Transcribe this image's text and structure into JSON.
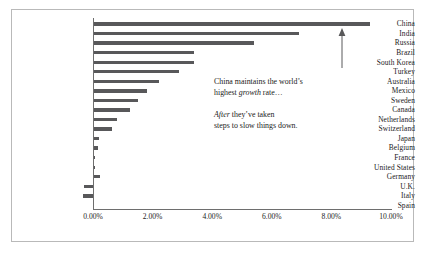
{
  "chart_data": {
    "type": "bar",
    "orientation": "horizontal",
    "title": "",
    "xlabel": "",
    "ylabel": "",
    "xlim": [
      0,
      10
    ],
    "xticks": [
      0,
      2,
      4,
      6,
      8,
      10
    ],
    "xtick_labels": [
      "0.00%",
      "2.00%",
      "4.00%",
      "6.00%",
      "8.00%",
      "10.00%"
    ],
    "grid": false,
    "legend": null,
    "value_unit": "percent",
    "categories": [
      "China",
      "India",
      "Russia",
      "Brazil",
      "South Korea",
      "Turkey",
      "Australia",
      "Mexico",
      "Sweden",
      "Canada",
      "Netherlands",
      "Switzerland",
      "Japan",
      "Belgium",
      "France",
      "United States",
      "Germany",
      "U.K.",
      "Italy",
      "Spain"
    ],
    "values": [
      9.3,
      6.9,
      5.4,
      3.4,
      3.4,
      2.9,
      2.2,
      1.8,
      1.5,
      1.25,
      0.8,
      0.65,
      0.2,
      0.18,
      0.08,
      0.06,
      0.22,
      -0.3,
      -0.35,
      0.0
    ]
  },
  "annotations": {
    "note1_line1_a": "China maintains the world’s",
    "note1_line2_a": "highest ",
    "note1_line2_em": "growth",
    "note1_line2_b": " rate…",
    "note2_line1_em": "After",
    "note2_line1_b": " they’ve taken",
    "note2_line2": "steps to slow things down."
  },
  "style": {
    "bar_color": "#58585a",
    "axis_color": "#6e6e6e",
    "text_color": "#1b1b1b",
    "frame_color": "#b9b9b9",
    "background": "#ffffff"
  }
}
